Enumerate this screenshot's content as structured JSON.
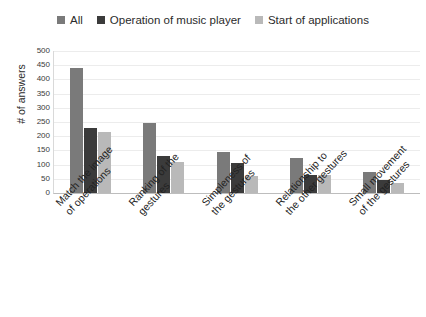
{
  "legend": {
    "position": "top-center",
    "items": [
      {
        "label": "All",
        "color": "#7a7a7a",
        "icon": "square-swatch-icon"
      },
      {
        "label": "Operation of music player",
        "color": "#3b3b3b",
        "icon": "square-swatch-icon"
      },
      {
        "label": "Start of applications",
        "color": "#b9b9b9",
        "icon": "square-swatch-icon"
      }
    ]
  },
  "axes": {
    "ylabel": "# of answers",
    "yticks": [
      "500",
      "450",
      "400",
      "350",
      "300",
      "250",
      "200",
      "150",
      "100",
      "50",
      "0"
    ]
  },
  "categories_split": [
    {
      "line1": "Match the image",
      "line2": "of operations"
    },
    {
      "line1": "Ranking of the",
      "line2": "gestures"
    },
    {
      "line1": "Simpleness of",
      "line2": "the gestures"
    },
    {
      "line1": "Relationship to",
      "line2": "the other gestures"
    },
    {
      "line1": "Small movement",
      "line2": "of the gestures"
    }
  ],
  "chart_data": {
    "type": "bar",
    "title": "",
    "xlabel": "",
    "ylabel": "# of answers",
    "ylim": [
      0,
      500
    ],
    "ytick_step": 50,
    "grid": true,
    "legend_position": "top-center",
    "categories": [
      "Match the image of operations",
      "Ranking of the gestures",
      "Simpleness of the gestures",
      "Relationship to the other gestures",
      "Small movement of the gestures"
    ],
    "series": [
      {
        "name": "All",
        "color": "#7a7a7a",
        "values": [
          440,
          245,
          145,
          125,
          75
        ]
      },
      {
        "name": "Operation of music player",
        "color": "#3b3b3b",
        "values": [
          230,
          130,
          105,
          65,
          45
        ]
      },
      {
        "name": "Start of applications",
        "color": "#b9b9b9",
        "values": [
          215,
          110,
          60,
          65,
          35
        ]
      }
    ]
  }
}
